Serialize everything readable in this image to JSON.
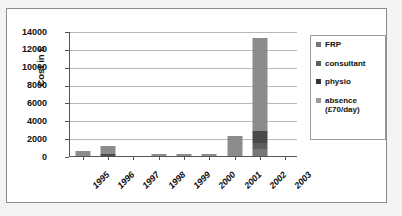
{
  "chart_data": {
    "type": "bar",
    "stacked": true,
    "title": "",
    "xlabel": "",
    "ylabel": "Cost in £",
    "ylim": [
      0,
      14000
    ],
    "ytick_step": 2000,
    "yticks": [
      "14000",
      "12000",
      "10000",
      "8000",
      "6000",
      "4000",
      "2000",
      "0"
    ],
    "grid": true,
    "legend_position": "right",
    "categories": [
      "1995",
      "1996",
      "1997",
      "1998",
      "1999",
      "2000",
      "2001",
      "2002",
      "2003"
    ],
    "series": [
      {
        "name": "absence (£70/day)",
        "color": "#8c8c8c",
        "values": [
          530,
          950,
          0,
          180,
          170,
          190,
          2270,
          10400,
          0
        ]
      },
      {
        "name": "physio",
        "color": "#4a4a4a",
        "values": [
          0,
          190,
          0,
          0,
          0,
          0,
          0,
          1300,
          0
        ]
      },
      {
        "name": "consultant",
        "color": "#5e5e5e",
        "values": [
          0,
          0,
          0,
          0,
          0,
          0,
          0,
          700,
          0
        ]
      },
      {
        "name": "FRP",
        "color": "#777777",
        "values": [
          0,
          0,
          0,
          0,
          0,
          0,
          0,
          800,
          0
        ]
      }
    ],
    "totals": [
      530,
      1140,
      0,
      180,
      170,
      190,
      2270,
      13200,
      0
    ]
  },
  "legend": {
    "items": [
      {
        "label": "FRP",
        "color": "#777777"
      },
      {
        "label": "consultant",
        "color": "#5e5e5e"
      },
      {
        "label": "physio",
        "color": "#333333"
      },
      {
        "label": "absence",
        "label2": "(£70/day)",
        "color": "#9a9a9a"
      }
    ]
  }
}
